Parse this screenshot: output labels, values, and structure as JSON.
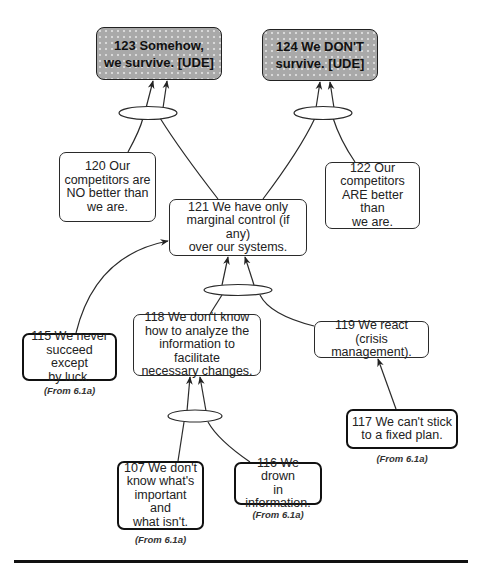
{
  "diagram": {
    "type": "current-reality-tree",
    "nodes": [
      {
        "id": "123",
        "text": "123  Somehow,\nwe survive.  [UDE]",
        "kind": "UDE",
        "fill": "#a9a9a9"
      },
      {
        "id": "124",
        "text": "124  We DON'T\nsurvive.  [UDE]",
        "kind": "UDE",
        "fill": "#a9a9a9"
      },
      {
        "id": "120",
        "text": "120  Our\ncompetitors are\nNO better than\nwe are."
      },
      {
        "id": "122",
        "text": "122  Our\ncompetitors\nARE better than\nwe are."
      },
      {
        "id": "121",
        "text": "121  We have only\nmarginal control (if any)\nover our systems."
      },
      {
        "id": "115",
        "text": "115  We never\nsucceed except\nby luck.",
        "source": "(From  6.1a)"
      },
      {
        "id": "118",
        "text": "118  We don't know\nhow to analyze the\ninformation to facilitate\nnecessary changes."
      },
      {
        "id": "119",
        "text": "119  We react (crisis\nmanagement)."
      },
      {
        "id": "117",
        "text": "117  We can't stick\nto a fixed plan.",
        "source": "(From  6.1a)"
      },
      {
        "id": "107",
        "text": "107  We don't\nknow what's\nimportant and\nwhat isn't.",
        "source": "(From  6.1a)"
      },
      {
        "id": "116",
        "text": "116  We drown\nin information.",
        "source": "(From  6.1a)"
      }
    ],
    "edges": [
      {
        "from": [
          "120",
          "121"
        ],
        "to": "123",
        "and_junction": true
      },
      {
        "from": [
          "121",
          "122"
        ],
        "to": "124",
        "and_junction": true
      },
      {
        "from": [
          "115"
        ],
        "to": "121",
        "and_junction": false
      },
      {
        "from": [
          "118",
          "119"
        ],
        "to": "121",
        "and_junction": true
      },
      {
        "from": [
          "107",
          "116"
        ],
        "to": "118",
        "and_junction": true
      },
      {
        "from": [
          "117"
        ],
        "to": "119",
        "and_junction": false
      }
    ]
  }
}
